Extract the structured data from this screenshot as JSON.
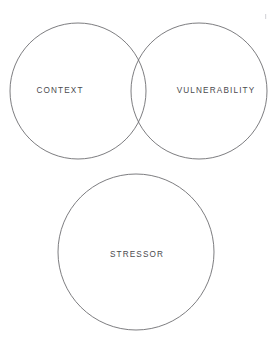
{
  "diagram": {
    "type": "venn",
    "title": "",
    "background_color": "#ffffff",
    "stroke_color": "#6e6e72",
    "text_color": "#4a4a4e",
    "sets": [
      {
        "id": "context",
        "label": "CONTEXT",
        "cx": 78,
        "cy": 91,
        "r": 68,
        "label_x": 60,
        "label_y": 91
      },
      {
        "id": "vulnerability",
        "label": "VULNERABILITY",
        "cx": 199,
        "cy": 91,
        "r": 68,
        "label_x": 216,
        "label_y": 91
      },
      {
        "id": "stressor",
        "label": "STRESSOR",
        "cx": 136,
        "cy": 252,
        "r": 78,
        "label_x": 137,
        "label_y": 255
      }
    ],
    "overlaps": [
      {
        "between": [
          "context",
          "vulnerability"
        ],
        "label": "",
        "top_intersection_x": 138,
        "top_intersection_y": 28,
        "bottom_intersection_x": 138,
        "bottom_intersection_y": 155
      }
    ]
  }
}
